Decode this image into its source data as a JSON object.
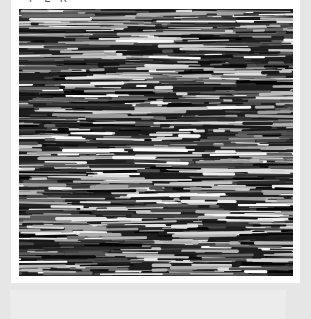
{
  "figure": {
    "caption_partial": "P E R",
    "texture_description": "grayscale horizontal streak texture",
    "colors": {
      "background": "#e6e6e6",
      "panel": "#ffffff",
      "texture_dark": "#111111",
      "texture_light": "#f0f0f0"
    }
  }
}
